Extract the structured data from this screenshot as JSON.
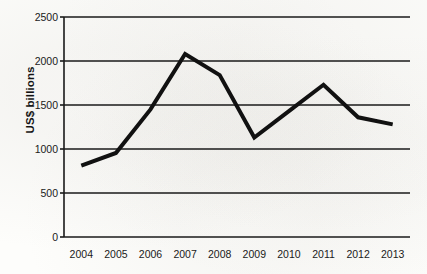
{
  "chart_data": {
    "type": "line",
    "title": "",
    "xlabel": "",
    "ylabel": "US$ billions",
    "categories": [
      "2004",
      "2005",
      "2006",
      "2007",
      "2008",
      "2009",
      "2010",
      "2011",
      "2012",
      "2013"
    ],
    "values": [
      810,
      955,
      1450,
      2080,
      1840,
      1130,
      1430,
      1730,
      1360,
      1280
    ],
    "series": [
      {
        "name": "US$ billions",
        "values": [
          810,
          955,
          1450,
          2080,
          1840,
          1130,
          1430,
          1730,
          1360,
          1280
        ]
      }
    ],
    "ylim": [
      0,
      2500
    ],
    "ytick_labels": [
      "0",
      "500",
      "1000",
      "1500",
      "2000",
      "2500"
    ],
    "ytick_values": [
      0,
      500,
      1000,
      1500,
      2000,
      2500
    ],
    "grid": true,
    "grid_axis": "y",
    "legend": false,
    "legend_position": "none",
    "line_color": "#111111",
    "line_width": 4,
    "markers": false,
    "background_color": "#fdfdfb",
    "axis_color": "#1a1a1a",
    "annotations": []
  },
  "axis": {
    "y_title": "US$ billions"
  }
}
